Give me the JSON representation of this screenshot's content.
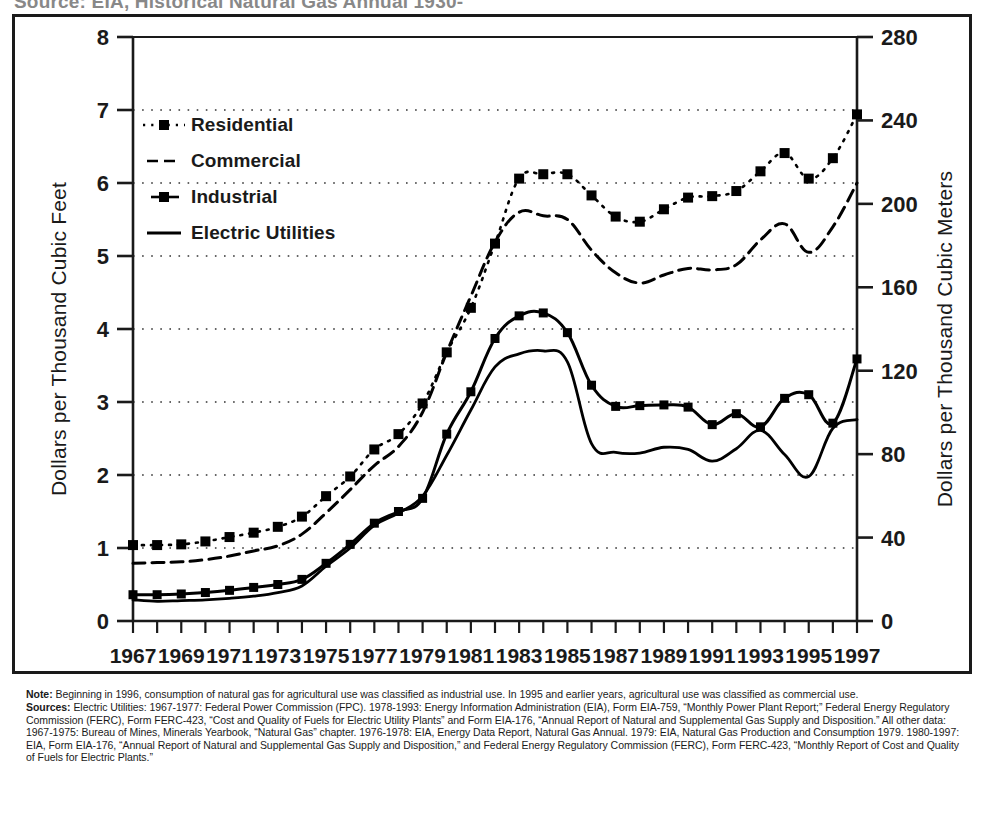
{
  "top_caption": "Source: EIA, Historical Natural Gas Annual 1930-",
  "axes": {
    "y_left_title": "Dollars per Thousand Cubic Feet",
    "y_right_title": "Dollars per Thousand Cubic Meters",
    "y_left_ticks": [
      "0",
      "1",
      "2",
      "3",
      "4",
      "5",
      "6",
      "7",
      "8"
    ],
    "y_right_ticks": [
      "0",
      "40",
      "80",
      "120",
      "160",
      "200",
      "240",
      "280"
    ],
    "x_ticks": [
      "1967",
      "1969",
      "1971",
      "1973",
      "1975",
      "1977",
      "1979",
      "1981",
      "1983",
      "1985",
      "1987",
      "1989",
      "1991",
      "1993",
      "1995",
      "1997"
    ]
  },
  "legend": {
    "items": [
      {
        "label": "Residential",
        "key": "dotted-square-marker",
        "color": "#000000"
      },
      {
        "label": "Commercial",
        "key": "dashed-line",
        "color": "#000000"
      },
      {
        "label": "Industrial",
        "key": "solid-small-square-marker",
        "color": "#000000"
      },
      {
        "label": "Electric Utilities",
        "key": "solid-line",
        "color": "#000000"
      }
    ]
  },
  "notes": {
    "note_lead": "Note:",
    "note_text": " Beginning in 1996, consumption of natural gas for agricultural use was classified as industrial use. In 1995 and earlier years, agricultural use was classified as commercial use.",
    "sources_lead": "Sources:",
    "sources_text": " Electric Utilities: 1967-1977: Federal Power Commission (FPC). 1978-1993: Energy Information Administration (EIA), Form EIA-759, “Monthly Power Plant Report;” Federal Energy Regulatory Commission (FERC), Form FERC-423, “Cost and Quality of Fuels for Electric Utility Plants” and Form EIA-176, “Annual Report of Natural and Supplemental Gas Supply and Disposition.”  All other data: 1967-1975: Bureau of Mines, Minerals Yearbook, “Natural Gas” chapter.  1976-1978: EIA, Energy Data Report, Natural Gas Annual. 1979: EIA, Natural Gas Production and Consumption 1979. 1980-1997: EIA, Form EIA-176, “Annual Report of Natural and Supplemental Gas Supply and Disposition,” and Federal Energy Regulatory Commission (FERC), Form FERC-423, “Monthly Report of Cost and Quality of Fuels for Electric Plants.”"
  },
  "chart_data": {
    "type": "line",
    "title": "",
    "xlabel": "",
    "ylabel": "Dollars per Thousand Cubic Feet",
    "ylabel_right": "Dollars per Thousand Cubic Meters",
    "xlim": [
      1967,
      1997
    ],
    "ylim": [
      0,
      8
    ],
    "ylim_right": [
      0,
      280
    ],
    "grid": true,
    "legend_position": "upper-left-inside",
    "x": [
      1967,
      1968,
      1969,
      1970,
      1971,
      1972,
      1973,
      1974,
      1975,
      1976,
      1977,
      1978,
      1979,
      1980,
      1981,
      1982,
      1983,
      1984,
      1985,
      1986,
      1987,
      1988,
      1989,
      1990,
      1991,
      1992,
      1993,
      1994,
      1995,
      1996,
      1997
    ],
    "series": [
      {
        "name": "Residential",
        "style": "dotted-with-square-markers",
        "values": [
          1.04,
          1.04,
          1.05,
          1.09,
          1.15,
          1.21,
          1.29,
          1.43,
          1.71,
          1.98,
          2.35,
          2.56,
          2.98,
          3.68,
          4.29,
          5.17,
          6.06,
          6.12,
          6.12,
          5.83,
          5.54,
          5.47,
          5.64,
          5.8,
          5.82,
          5.89,
          6.16,
          6.41,
          6.06,
          6.34,
          6.94
        ]
      },
      {
        "name": "Commercial",
        "style": "dashed",
        "values": [
          0.79,
          0.8,
          0.81,
          0.84,
          0.89,
          0.96,
          1.03,
          1.19,
          1.48,
          1.8,
          2.13,
          2.39,
          2.86,
          3.68,
          4.45,
          5.19,
          5.6,
          5.55,
          5.5,
          5.08,
          4.77,
          4.63,
          4.74,
          4.83,
          4.81,
          4.88,
          5.22,
          5.44,
          5.05,
          5.4,
          6.0
        ]
      },
      {
        "name": "Industrial",
        "style": "solid-with-square-markers",
        "values": [
          0.36,
          0.36,
          0.37,
          0.39,
          0.42,
          0.46,
          0.5,
          0.57,
          0.79,
          1.05,
          1.34,
          1.5,
          1.68,
          2.56,
          3.14,
          3.87,
          4.18,
          4.22,
          3.95,
          3.23,
          2.94,
          2.95,
          2.96,
          2.93,
          2.69,
          2.84,
          2.66,
          3.05,
          3.1,
          2.71,
          3.59
        ]
      },
      {
        "name": "Electric Utilities",
        "style": "solid",
        "values": [
          0.29,
          0.27,
          0.28,
          0.29,
          0.31,
          0.34,
          0.39,
          0.48,
          0.75,
          1.0,
          1.31,
          1.48,
          1.71,
          2.27,
          2.89,
          3.48,
          3.66,
          3.7,
          3.55,
          2.43,
          2.31,
          2.3,
          2.38,
          2.35,
          2.19,
          2.36,
          2.61,
          2.28,
          1.98,
          2.64,
          2.76
        ]
      }
    ]
  }
}
